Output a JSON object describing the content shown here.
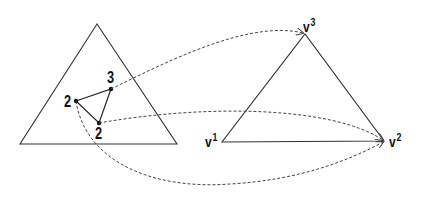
{
  "diagram": {
    "colors": {
      "stroke": "#333333",
      "dashed": "#444444",
      "background": "#ffffff"
    },
    "source_triangle": {
      "vertices": [
        [
          97,
          24
        ],
        [
          20,
          144
        ],
        [
          177,
          144
        ]
      ]
    },
    "inner_triangle": {
      "points": [
        {
          "label": "2",
          "x": 76,
          "y": 101
        },
        {
          "label": "3",
          "x": 111,
          "y": 89
        },
        {
          "label": "2",
          "x": 99,
          "y": 123
        }
      ]
    },
    "target_triangle": {
      "vertices": [
        {
          "base": "v",
          "sup": "1",
          "x": 222,
          "y": 142
        },
        {
          "base": "v",
          "sup": "2",
          "x": 384,
          "y": 141
        },
        {
          "base": "v",
          "sup": "3",
          "x": 305,
          "y": 34
        }
      ]
    },
    "mappings": [
      {
        "from": "3",
        "to": "v3"
      },
      {
        "from": "2 (bottom)",
        "to": "v2"
      },
      {
        "from": "2 (left)",
        "to": "v2"
      }
    ]
  },
  "labels": {
    "inner_left": "2",
    "inner_top": "3",
    "inner_bottom": "2",
    "v1_base": "v",
    "v1_sup": "1",
    "v2_base": "v",
    "v2_sup": "2",
    "v3_base": "v",
    "v3_sup": "3"
  }
}
